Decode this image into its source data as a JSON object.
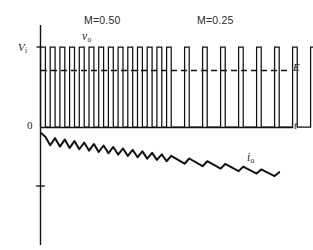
{
  "figure": {
    "kind": "waveform-diagram",
    "background_color": "#ffffff",
    "ink_color": "#000000",
    "width": 313,
    "height": 250
  },
  "labels": {
    "vi": "V",
    "vi_sub": "i",
    "zero": "0",
    "time_axis": "t",
    "e_level": "E",
    "vo": "v",
    "vo_sub": "o",
    "io": "i",
    "io_sub": "o",
    "modulation_left": "M=0.50",
    "modulation_right": "M=0.25"
  },
  "chart_data": {
    "type": "line",
    "title": "",
    "xlabel": "t",
    "ylabel": "",
    "grid": false,
    "legend": "none",
    "annotations": [
      {
        "text": "M=0.50",
        "x_px": 84,
        "y_px": 15,
        "meaning": "modulation index for first half of the record"
      },
      {
        "text": "M=0.25",
        "x_px": 197,
        "y_px": 15,
        "meaning": "modulation index for second half of the record"
      },
      {
        "text": "v_o",
        "x_px": 82,
        "y_px": 31,
        "meaning": "output voltage waveform label"
      },
      {
        "text": "i_o",
        "x_px": 247,
        "y_px": 152,
        "meaning": "output current waveform label"
      },
      {
        "text": "V_i",
        "x_px": 18,
        "y_px": 42,
        "meaning": "input supply voltage level on vertical axis"
      },
      {
        "text": "E",
        "x_px": 293,
        "y_px": 62,
        "meaning": "back-emf / average level, dashed reference line"
      },
      {
        "text": "0",
        "x_px": 27,
        "y_px": 120,
        "meaning": "origin"
      },
      {
        "text": "t",
        "x_px": 294,
        "y_px": 120,
        "meaning": "time axis label"
      }
    ],
    "axes": {
      "origin_px": {
        "x": 40,
        "y": 127
      },
      "x_axis_px": {
        "x_start": 40,
        "x_end": 295,
        "y": 127
      },
      "y_axis_px": {
        "x": 40,
        "y_top": 25,
        "y_bottom": 245
      },
      "y_tick_px": [
        {
          "y": 186,
          "label": ""
        }
      ],
      "vi_level_px": 47,
      "zero_level_px": 127,
      "e_level_px": 70
    },
    "series": [
      {
        "name": "v_o",
        "type": "pulse-train",
        "description": "Chopper output voltage: rectangular pulses between 0 and V_i. First group has 50% duty ratio, second group 25% duty ratio.",
        "low_value": 0,
        "high_value": 1.0,
        "e_reference": 0.71,
        "groups": [
          {
            "name": "M=0.50",
            "duty": 0.5,
            "pulse_count": 13,
            "period_px": 9.7,
            "x_start_px": 40.5,
            "pulse_width_px": 4.9
          },
          {
            "name": "M=0.25",
            "duty": 0.25,
            "pulse_count": 9,
            "period_px": 18.0,
            "x_start_px": 166.6,
            "pulse_width_px": 4.6
          }
        ]
      },
      {
        "name": "i_o",
        "type": "sawtooth-ripple",
        "description": "Output current: triangular ripple riding on a decaying average. Average falls from about 0.30 to about 0.12 of V_i scale as the modulation index drops from 0.50 to 0.25.",
        "ripple_peak_to_peak_start": 0.1,
        "ripple_peak_to_peak_end": 0.055,
        "mean_start": 0.3,
        "mean_end": 0.125,
        "x_start_px": 41,
        "x_end_px": 290,
        "y_start_px": 140,
        "y_end_px": 176,
        "segment_count_left": 13,
        "segment_count_right": 9
      }
    ]
  }
}
